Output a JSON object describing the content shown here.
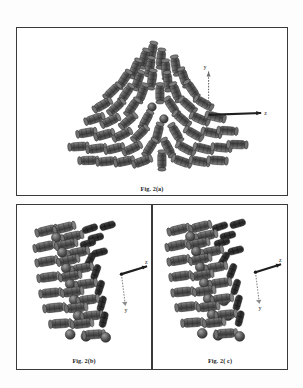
{
  "document": {
    "type": "scanned-figure",
    "figure_number": "Fig. 2",
    "background_color": "#fdfdfd",
    "frame_color": "#3a3a3a"
  },
  "panels": [
    {
      "id": "a",
      "caption": "Fig. 2(a)",
      "view": "axial-cross-section",
      "arrangement": "triangular-cluster",
      "unit_shape": "capsule",
      "unit_color": "#4a4a4a",
      "unit_count": 61,
      "axis_triad": {
        "present": true,
        "labels": [
          "z",
          "y"
        ],
        "position": "right"
      }
    },
    {
      "id": "b",
      "caption": "Fig. 2(b)",
      "view": "longitudinal-side",
      "arrangement": "helical-stack",
      "unit_shape": "capsule",
      "unit_color": "#4a4a4a",
      "unit_count": 40,
      "axis_triad": {
        "present": true,
        "labels": [
          "z",
          "y"
        ],
        "position": "right"
      }
    },
    {
      "id": "c",
      "caption": "Fig. 2( c)",
      "view": "longitudinal-side",
      "arrangement": "helical-stack",
      "unit_shape": "capsule",
      "unit_color": "#4a4a4a",
      "unit_count": 42,
      "axis_triad": {
        "present": true,
        "labels": [
          "z",
          "y"
        ],
        "position": "right"
      }
    }
  ],
  "axis": {
    "z_label": "z",
    "y_label": "y",
    "line_color": "#555555"
  }
}
